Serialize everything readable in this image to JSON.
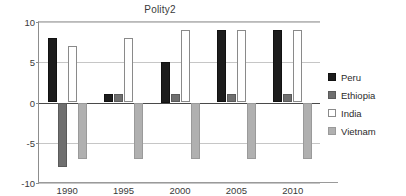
{
  "chart_data": {
    "type": "bar",
    "title": "Polity2",
    "xlabel": "",
    "ylabel": "",
    "categories": [
      "1990",
      "1995",
      "2000",
      "2005",
      "2010"
    ],
    "series": [
      {
        "name": "Peru",
        "color": "#1c1c1c",
        "values": [
          8,
          1,
          5,
          9,
          9
        ]
      },
      {
        "name": "Ethiopia",
        "color": "#6f6f6f",
        "values": [
          -8,
          1,
          1,
          1,
          1
        ]
      },
      {
        "name": "India",
        "color": "#ffffff",
        "values": [
          7,
          8,
          9,
          9,
          9
        ]
      },
      {
        "name": "Vietnam",
        "color": "#b0b0b0",
        "values": [
          -7,
          -7,
          -7,
          -7,
          -7
        ]
      }
    ],
    "ylim": [
      -10,
      10
    ],
    "yticks": [
      10,
      5,
      0,
      -5,
      -10
    ],
    "grid": true,
    "legend_position": "right"
  },
  "legend": {
    "items": [
      {
        "label": "Peru"
      },
      {
        "label": "Ethiopia"
      },
      {
        "label": "India"
      },
      {
        "label": "Vietnam"
      }
    ]
  }
}
